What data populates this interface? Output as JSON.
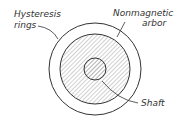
{
  "diagram": {
    "labels": {
      "hysteresis_rings_line1": "Hysteresis",
      "hysteresis_rings_line2": "rings",
      "arbor_line1": "Nonmagnetic",
      "arbor_line2": "arbor",
      "shaft": "Shaft"
    },
    "colors": {
      "stroke": "#333333",
      "hatch": "#999999",
      "background": "#ffffff"
    }
  }
}
